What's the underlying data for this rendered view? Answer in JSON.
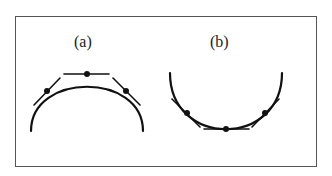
{
  "figure": {
    "panels": [
      {
        "id": "a",
        "label": "(a)",
        "shape": "concave-down arc (cap)",
        "points": 3,
        "tangent_lines": 3
      },
      {
        "id": "b",
        "label": "(b)",
        "shape": "concave-up arc (cup)",
        "points": 3,
        "tangent_lines": 3
      }
    ],
    "colors": {
      "stroke": "#111111",
      "frame": "#555555",
      "background": "#ffffff"
    }
  }
}
